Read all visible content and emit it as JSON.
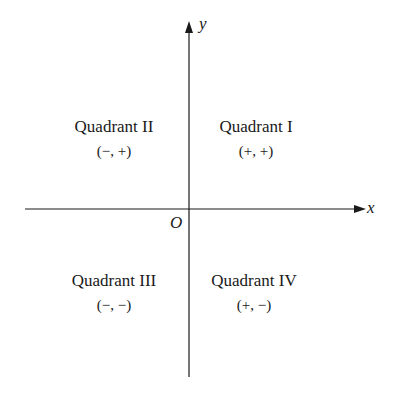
{
  "diagram": {
    "type": "coordinate-plane",
    "axes": {
      "x_label": "x",
      "y_label": "y",
      "origin_label": "O"
    },
    "quadrants": [
      {
        "name": "Quadrant I",
        "signs": "(+, +)"
      },
      {
        "name": "Quadrant II",
        "signs": "(−, +)"
      },
      {
        "name": "Quadrant III",
        "signs": "(−, −)"
      },
      {
        "name": "Quadrant IV",
        "signs": "(+, −)"
      }
    ],
    "colors": {
      "line": "#1a1a1a",
      "background": "#ffffff"
    }
  }
}
